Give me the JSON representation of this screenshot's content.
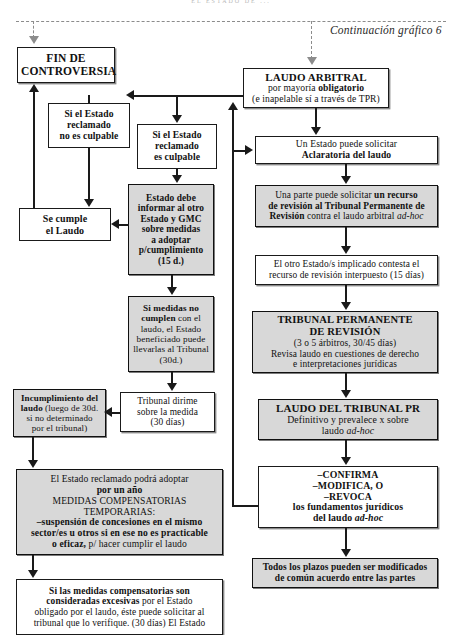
{
  "page": {
    "header_faint": "EL ESTADO DE ...",
    "continuation_note": "Continuación gráfico 6"
  },
  "nodes": {
    "fin_controversia": {
      "label": "FIN DE CONTROVERSIA",
      "line1": "FIN DE",
      "line2": "CONTROVERSIA"
    },
    "laudo_arbitral": {
      "line1": "LAUDO ARBITRAL",
      "line2_a": "por mayoría ",
      "line2_b": "obligatorio",
      "line3": "(e inapelable sí a través de TPR)"
    },
    "si_no_culpable": {
      "line1": "Si el Estado",
      "line2": "reclamado",
      "line3": "no es culpable"
    },
    "si_culpable": {
      "line1": "Si el Estado",
      "line2": "reclamado",
      "line3": "es culpable"
    },
    "se_cumple": {
      "line1": "Se cumple",
      "line2": "el Laudo"
    },
    "estado_informar": {
      "line1": "Estado debe",
      "line2": "informar al otro",
      "line3": "Estado y GMC",
      "line4": "sobre medidas",
      "line5": "a adoptar",
      "line6": "p/cumplimiento",
      "line7": "(15 d.)"
    },
    "medidas_no_cumplen": {
      "bold1": "Si medidas no",
      "bold2": "cumplen",
      "rest1": " con el",
      "line2": "laudo, el Estado",
      "line3": "beneficiado puede",
      "line4": "llevarlas al Tribunal",
      "line5": "(30d.)"
    },
    "tribunal_dirime": {
      "line1": "Tribunal dirime",
      "line2": "sobre la medida",
      "line3": "(30 días)"
    },
    "incumplimiento": {
      "bold1": "Incumplimiento del",
      "bold2": "laudo",
      "rest1": " (luego de 30d.",
      "line2": "si no determinado",
      "line3": "por el tribunal)"
    },
    "medidas_compensatorias": {
      "line1": "El Estado reclamado podrá adoptar",
      "line2": "por un año",
      "line3": "MEDIDAS COMPENSATORIAS",
      "line4": "TEMPORARIAS:",
      "line5": "–suspensión de concesiones en el mismo",
      "line6": "sector/es u otros si en ese no es practicable",
      "line7_b": "o eficaz,",
      "line7_r": " p/ hacer cumplir el laudo"
    },
    "medidas_excesivas": {
      "line1": "Si las medidas compensatorias son",
      "line2_b": "consideradas excesivas",
      "line2_r": " por el Estado",
      "line3": "obligado por el laudo, éste puede solicitar al",
      "line4": "tribunal que lo verifique. (30 días) El Estado"
    },
    "aclaratoria": {
      "line1": "Un Estado puede solicitar",
      "line2": "Aclaratoria del laudo"
    },
    "recurso_revision": {
      "l1_r": "Una parte puede solicitar ",
      "l1_b": "un recurso",
      "l2_b": "de revisión al Tribunal Permanente de",
      "l3_b": "Revisión",
      "l3_r": " contra el laudo arbitral ",
      "l3_i": "ad-hoc"
    },
    "contesta_recurso": {
      "line1": "El otro Estado/s implicado contesta el",
      "line2": "recurso de revisión interpuesto (15 días)"
    },
    "tribunal_permanente": {
      "line1": "TRIBUNAL PERMANENTE",
      "line2": "DE REVISIÓN",
      "line3": "(3 o 5 árbitros, 30/45 días)",
      "line4": "Revisa laudo en cuestiones de derecho",
      "line5": "e interpretaciones jurídicas"
    },
    "laudo_tribunal_pr": {
      "line1": "LAUDO DEL TRIBUNAL PR",
      "line2": "Definitivo y prevalece x sobre",
      "line3_r": "laudo ",
      "line3_i": "ad-hoc"
    },
    "confirma_modifica": {
      "line1": "–CONFIRMA",
      "line2": "–MODIFICA, O",
      "line3": "–REVOCA",
      "line4": "los fundamentos jurídicos",
      "line5_r": "del laudo ",
      "line5_i": "ad-hoc"
    },
    "plazos": {
      "line1": "Todos los plazos pueden ser modificados",
      "line2": "de común acuerdo entre las partes"
    }
  },
  "colors": {
    "line": "#1a1a1a",
    "shaded_fill": "#d8d8d8",
    "dashed": "#8c8c8c",
    "background": "#ffffff"
  }
}
